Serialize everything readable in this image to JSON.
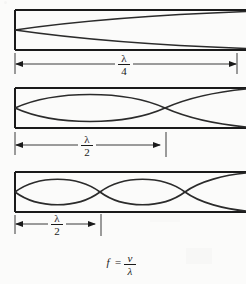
{
  "figure": {
    "background_color": "#fbfbfa",
    "ink_color": "#1a1a1a",
    "panels": [
      {
        "id": "panel-quarter-wave",
        "harmonic_label": "fundamental",
        "dimension_label_numerator": "λ",
        "dimension_label_denominator": "4",
        "dimension_fraction": "λ/4",
        "loops": 0.5,
        "node_positions_px": [
          15
        ],
        "box": {
          "x": 15,
          "y": 10,
          "width": 231,
          "height": 40
        },
        "dimension": {
          "start_x": 15,
          "end_x": 237,
          "y": 64,
          "end_style": "arrow"
        }
      },
      {
        "id": "panel-half-wave-second",
        "harmonic_label": "second",
        "dimension_label_numerator": "λ",
        "dimension_label_denominator": "2",
        "dimension_fraction": "λ/2",
        "loops": 1.5,
        "node_positions_px": [
          15,
          165
        ],
        "box": {
          "x": 15,
          "y": 88,
          "width": 231,
          "height": 40
        },
        "dimension": {
          "start_x": 15,
          "end_x": 166,
          "y": 145,
          "end_style": "arrow-with-tick"
        }
      },
      {
        "id": "panel-half-wave-third",
        "harmonic_label": "third",
        "dimension_label_numerator": "λ",
        "dimension_label_denominator": "2",
        "dimension_fraction": "λ/2",
        "loops": 2.7,
        "node_positions_px": [
          15,
          100,
          185
        ],
        "box": {
          "x": 15,
          "y": 172,
          "width": 231,
          "height": 40
        },
        "dimension": {
          "start_x": 15,
          "end_x": 101,
          "y": 224,
          "end_style": "arrow-with-tick"
        }
      }
    ],
    "formula": {
      "lhs": "f",
      "equals": "=",
      "numerator": "v",
      "denominator": "λ",
      "full": "f = v/λ"
    }
  }
}
